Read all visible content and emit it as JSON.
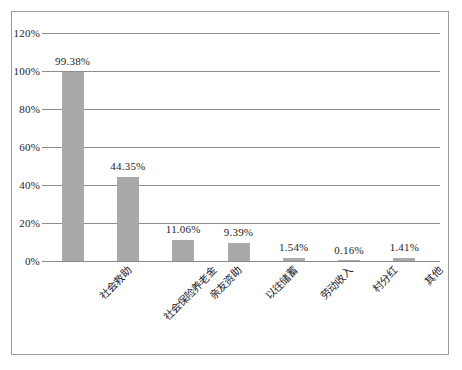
{
  "chart_data": {
    "type": "bar",
    "title": "",
    "subtitle": "",
    "xlabel": "",
    "ylabel": "",
    "categories": [
      "社会救助",
      "社会保险养老金",
      "亲友资助",
      "以往储蓄",
      "劳动收入",
      "村分红",
      "其他"
    ],
    "values": [
      99.38,
      44.35,
      11.06,
      9.39,
      1.54,
      0.16,
      1.41
    ],
    "value_labels": [
      "99.38%",
      "44.35%",
      "11.06%",
      "9.39%",
      "1.54%",
      "0.16%",
      "1.41%"
    ],
    "ylim": [
      0,
      120
    ],
    "yticks": [
      0,
      20,
      40,
      60,
      80,
      100,
      120
    ],
    "ytick_labels": [
      "0%",
      "20%",
      "40%",
      "60%",
      "80%",
      "100%",
      "120%"
    ],
    "grid": true,
    "legend": "none",
    "bar_color": "#a9a9a9",
    "gridline_color": "#8d8d8d",
    "border_color": "#9a9a9a",
    "text_color": "#24242a",
    "units": "percent"
  }
}
